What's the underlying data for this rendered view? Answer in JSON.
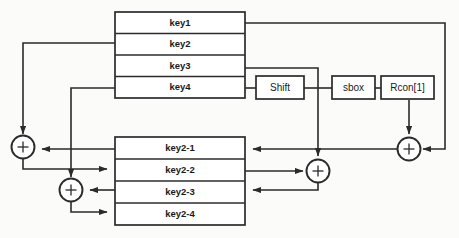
{
  "diagram": {
    "colors": {
      "stroke": "#2b2b2b",
      "fill": "#ffffff",
      "background": "#fbfbfa",
      "text": "#1a1a1a"
    },
    "input_table": {
      "name": "input-key-table",
      "rows": [
        {
          "label": "key1"
        },
        {
          "label": "key2"
        },
        {
          "label": "key3"
        },
        {
          "label": "key4"
        }
      ]
    },
    "output_table": {
      "name": "output-key-table",
      "rows": [
        {
          "label": "key2-1"
        },
        {
          "label": "key2-2"
        },
        {
          "label": "key2-3"
        },
        {
          "label": "key2-4"
        }
      ]
    },
    "operation_boxes": [
      {
        "name": "shift-box",
        "label": "Shift"
      },
      {
        "name": "sbox-box",
        "label": "sbox"
      },
      {
        "name": "rcon-box",
        "label": "Rcon[1]"
      }
    ],
    "xor_nodes": [
      {
        "name": "xor-node-1",
        "label": "+"
      },
      {
        "name": "xor-node-2",
        "label": "+"
      },
      {
        "name": "xor-node-3",
        "label": "+"
      },
      {
        "name": "xor-node-4",
        "label": "+"
      }
    ]
  }
}
